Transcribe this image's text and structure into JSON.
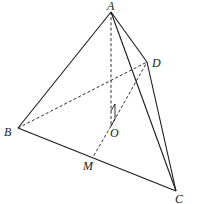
{
  "figure": {
    "type": "tetrahedron",
    "points": {
      "A": {
        "label": "A",
        "x": 111,
        "y": 12
      },
      "B": {
        "label": "B",
        "x": 18,
        "y": 128
      },
      "C": {
        "label": "C",
        "x": 176,
        "y": 191
      },
      "D": {
        "label": "D",
        "x": 147,
        "y": 62
      },
      "O": {
        "label": "O",
        "x": 111,
        "y": 126
      },
      "M": {
        "label": "M",
        "x": 93,
        "y": 157
      }
    },
    "solid_edges": [
      "AB",
      "AC",
      "AD",
      "BC",
      "DC"
    ],
    "dashed_edges": [
      "AO",
      "BD",
      "OD",
      "OM"
    ],
    "right_angle_at": "O",
    "stroke_color": "#1a1a1a",
    "background": "#ffffff"
  },
  "labels": {
    "A": "A",
    "B": "B",
    "C": "C",
    "D": "D",
    "O": "O",
    "M": "M"
  }
}
